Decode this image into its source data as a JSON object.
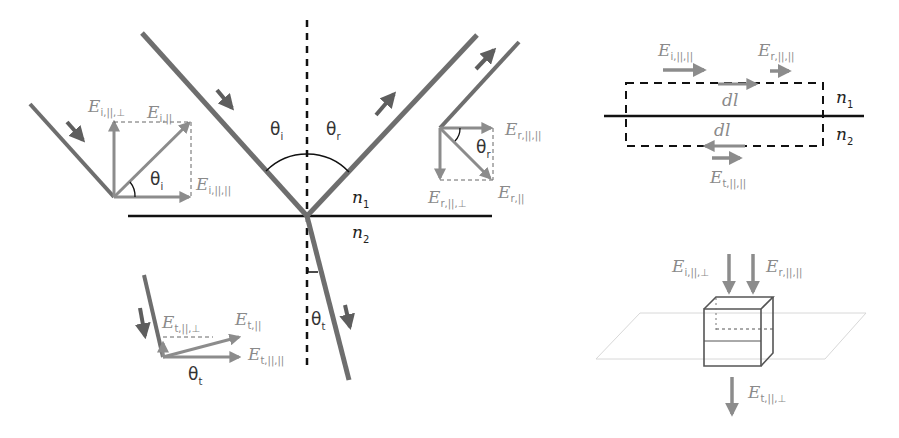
{
  "colors": {
    "ray": "#6e6e6e",
    "vector": "#8c8c8c",
    "label": "#8a8a8a",
    "ink": "#111111",
    "plane": "#d8d8d8"
  },
  "main_diagram": {
    "incident_angle": {
      "symbol": "θ",
      "sub": "i"
    },
    "reflected_angle": {
      "symbol": "θ",
      "sub": "r"
    },
    "transmitted_angle": {
      "symbol": "θ",
      "sub": "t"
    },
    "medium_1": {
      "symbol": "n",
      "sub": "1"
    },
    "medium_2": {
      "symbol": "n",
      "sub": "2"
    }
  },
  "incident_inset": {
    "perp": {
      "E": "E",
      "sub": "i,||,⊥"
    },
    "total": {
      "E": "E",
      "sub": "i,||"
    },
    "par": {
      "E": "E",
      "sub": "i,||,||"
    },
    "angle": {
      "symbol": "θ",
      "sub": "i"
    }
  },
  "reflected_inset": {
    "par": {
      "E": "E",
      "sub": "r,||,||"
    },
    "total": {
      "E": "E",
      "sub": "r,||"
    },
    "perp": {
      "E": "E",
      "sub": "r,||,⊥"
    },
    "angle": {
      "symbol": "θ",
      "sub": "r"
    }
  },
  "transmitted_inset": {
    "perp": {
      "E": "E",
      "sub": "t,||,⊥"
    },
    "total": {
      "E": "E",
      "sub": "t,||"
    },
    "par": {
      "E": "E",
      "sub": "t,||,||"
    },
    "angle": {
      "symbol": "θ",
      "sub": "t"
    }
  },
  "loop_diagram": {
    "e_incident": {
      "E": "E",
      "sub": "i,||,||"
    },
    "e_reflected": {
      "E": "E",
      "sub": "r,||,||"
    },
    "e_transmitted": {
      "E": "E",
      "sub": "t,||,||"
    },
    "dl_top": "dl",
    "dl_bottom": "dl",
    "medium_1": {
      "symbol": "n",
      "sub": "1"
    },
    "medium_2": {
      "symbol": "n",
      "sub": "2"
    }
  },
  "pillbox_diagram": {
    "e_incident": {
      "E": "E",
      "sub": "i,||,⊥"
    },
    "e_reflected": {
      "E": "E",
      "sub": "r,||,||"
    },
    "e_transmitted": {
      "E": "E",
      "sub": "t,||,⊥"
    }
  }
}
